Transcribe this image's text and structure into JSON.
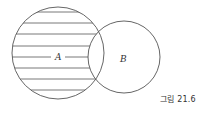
{
  "diagram": {
    "type": "venn",
    "sets": [
      {
        "name": "A",
        "label": "A",
        "cx": 58,
        "cy": 53,
        "r": 46,
        "shaded": "A minus B (horizontal hatching)"
      },
      {
        "name": "B",
        "label": "B",
        "cx": 124,
        "cy": 57,
        "r": 36,
        "shaded": "none"
      }
    ],
    "hatch_lines_y": [
      12,
      23,
      34,
      46,
      68,
      79,
      90
    ],
    "label_line_y": 57,
    "stroke_color": "#555555"
  },
  "caption": "그림 21.6"
}
